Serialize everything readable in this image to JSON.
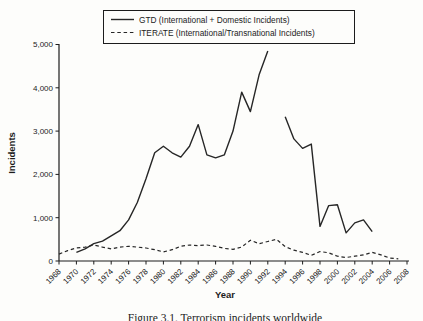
{
  "figure": {
    "caption": "Figure 3.1. Terrorism incidents worldwide",
    "background_color": "#fdfdfb",
    "line_color": "#262626"
  },
  "chart_data": {
    "type": "line",
    "title": "",
    "xlabel": "Year",
    "ylabel": "Incidents",
    "xlim": [
      1968,
      2008
    ],
    "ylim": [
      0,
      5000
    ],
    "grid": false,
    "legend_position": "top-center",
    "x_ticks": [
      1968,
      1970,
      1972,
      1974,
      1976,
      1978,
      1980,
      1982,
      1984,
      1986,
      1988,
      1990,
      1992,
      1994,
      1996,
      1998,
      2000,
      2002,
      2004,
      2006,
      2008
    ],
    "y_ticks": [
      0,
      1000,
      2000,
      3000,
      4000,
      5000
    ],
    "y_tick_labels": [
      "0",
      "1,000",
      "2,000",
      "3,000",
      "4,000",
      "5,000"
    ],
    "series": [
      {
        "name": "GTD (International + Domestic Incidents)",
        "style": "solid",
        "note": "no data for 1993 (gap in line)",
        "points": [
          [
            1970,
            200
          ],
          [
            1971,
            280
          ],
          [
            1972,
            400
          ],
          [
            1973,
            460
          ],
          [
            1974,
            580
          ],
          [
            1975,
            700
          ],
          [
            1976,
            950
          ],
          [
            1977,
            1350
          ],
          [
            1978,
            1900
          ],
          [
            1979,
            2500
          ],
          [
            1980,
            2650
          ],
          [
            1981,
            2500
          ],
          [
            1982,
            2400
          ],
          [
            1983,
            2650
          ],
          [
            1984,
            3150
          ],
          [
            1985,
            2450
          ],
          [
            1986,
            2380
          ],
          [
            1987,
            2450
          ],
          [
            1988,
            3000
          ],
          [
            1989,
            3900
          ],
          [
            1990,
            3450
          ],
          [
            1991,
            4300
          ],
          [
            1992,
            4850
          ],
          [
            1993,
            null
          ],
          [
            1994,
            3330
          ],
          [
            1995,
            2820
          ],
          [
            1996,
            2600
          ],
          [
            1997,
            2700
          ],
          [
            1998,
            800
          ],
          [
            1999,
            1280
          ],
          [
            2000,
            1300
          ],
          [
            2001,
            650
          ],
          [
            2002,
            880
          ],
          [
            2003,
            950
          ],
          [
            2004,
            680
          ]
        ]
      },
      {
        "name": "ITERATE (International/Transnational Incidents)",
        "style": "dashed",
        "points": [
          [
            1968,
            160
          ],
          [
            1969,
            240
          ],
          [
            1970,
            300
          ],
          [
            1971,
            320
          ],
          [
            1972,
            370
          ],
          [
            1973,
            320
          ],
          [
            1974,
            280
          ],
          [
            1975,
            320
          ],
          [
            1976,
            340
          ],
          [
            1977,
            320
          ],
          [
            1978,
            300
          ],
          [
            1979,
            260
          ],
          [
            1980,
            210
          ],
          [
            1981,
            260
          ],
          [
            1982,
            340
          ],
          [
            1983,
            370
          ],
          [
            1984,
            355
          ],
          [
            1985,
            370
          ],
          [
            1986,
            340
          ],
          [
            1987,
            290
          ],
          [
            1988,
            270
          ],
          [
            1989,
            320
          ],
          [
            1990,
            480
          ],
          [
            1991,
            400
          ],
          [
            1992,
            450
          ],
          [
            1993,
            500
          ],
          [
            1994,
            330
          ],
          [
            1995,
            250
          ],
          [
            1996,
            200
          ],
          [
            1997,
            130
          ],
          [
            1998,
            220
          ],
          [
            1999,
            190
          ],
          [
            2000,
            110
          ],
          [
            2001,
            80
          ],
          [
            2002,
            110
          ],
          [
            2003,
            140
          ],
          [
            2004,
            200
          ],
          [
            2005,
            140
          ],
          [
            2006,
            70
          ],
          [
            2007,
            50
          ]
        ]
      }
    ]
  }
}
